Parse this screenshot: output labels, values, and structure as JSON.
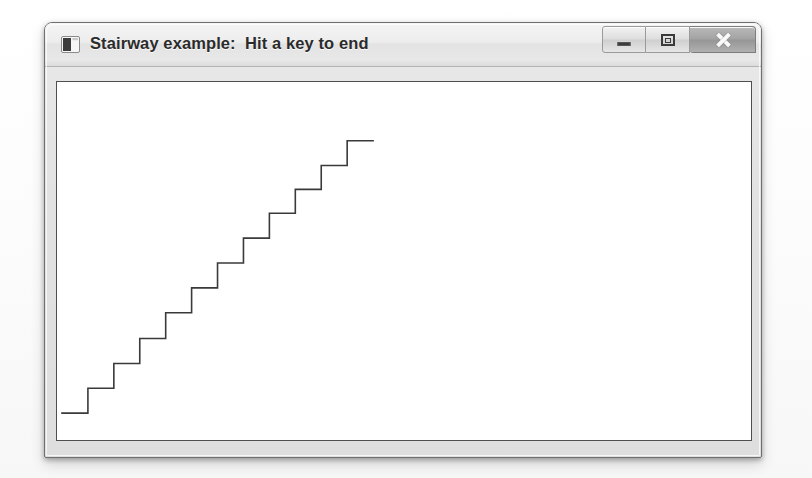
{
  "window": {
    "title": "Stairway example:  Hit a key to end",
    "icon": "app-window-icon",
    "controls": [
      {
        "name": "minimize",
        "glyph": "minimize-icon",
        "tooltip": "Minimize"
      },
      {
        "name": "maximize",
        "glyph": "maximize-icon",
        "tooltip": "Maximize"
      },
      {
        "name": "close",
        "glyph": "close-icon",
        "tooltip": "Close"
      }
    ],
    "colors": {
      "titlebar": "#ededed",
      "frame": "#e2e2e2",
      "border": "#6f6f6f",
      "client_background": "#ffffff",
      "client_border": "#4f4f4f"
    }
  },
  "chart_data": {
    "type": "line",
    "title": "Stairway",
    "xlabel": "",
    "ylabel": "",
    "grid": false,
    "legend": false,
    "line_color": "#3a3a3a",
    "line_width": 1.6,
    "steps": 12,
    "step_width": 26,
    "step_height": 26,
    "start": {
      "x": 5,
      "y": 333
    },
    "end": {
      "x": 317,
      "y": 34
    },
    "xlim": [
      0,
      696
    ],
    "ylim": [
      0,
      360
    ],
    "x": [
      5,
      31,
      31,
      57,
      57,
      83,
      83,
      109,
      109,
      135,
      135,
      161,
      161,
      187,
      187,
      213,
      213,
      239,
      239,
      265,
      265,
      291,
      291,
      317
    ],
    "y": [
      333,
      333,
      308,
      308,
      283,
      283,
      258,
      258,
      232,
      232,
      207,
      207,
      182,
      182,
      157,
      157,
      132,
      132,
      108,
      108,
      84,
      84,
      59,
      59
    ],
    "points": [
      {
        "x": 5,
        "y": 333
      },
      {
        "x": 31,
        "y": 333
      },
      {
        "x": 31,
        "y": 308
      },
      {
        "x": 57,
        "y": 308
      },
      {
        "x": 57,
        "y": 283
      },
      {
        "x": 83,
        "y": 283
      },
      {
        "x": 83,
        "y": 258
      },
      {
        "x": 109,
        "y": 258
      },
      {
        "x": 109,
        "y": 232
      },
      {
        "x": 135,
        "y": 232
      },
      {
        "x": 135,
        "y": 207
      },
      {
        "x": 161,
        "y": 207
      },
      {
        "x": 161,
        "y": 182
      },
      {
        "x": 187,
        "y": 182
      },
      {
        "x": 187,
        "y": 157
      },
      {
        "x": 213,
        "y": 157
      },
      {
        "x": 213,
        "y": 132
      },
      {
        "x": 239,
        "y": 132
      },
      {
        "x": 239,
        "y": 108
      },
      {
        "x": 265,
        "y": 108
      },
      {
        "x": 265,
        "y": 84
      },
      {
        "x": 291,
        "y": 84
      },
      {
        "x": 291,
        "y": 59
      },
      {
        "x": 317,
        "y": 59
      }
    ]
  }
}
